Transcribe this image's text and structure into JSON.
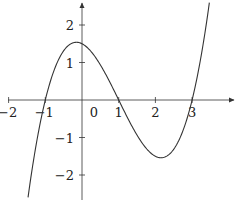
{
  "chart_data": {
    "type": "line",
    "title": "",
    "xlabel": "",
    "ylabel": "",
    "function": "f(x) = 0.5(x+1)(x-1)(x-3)",
    "x_ticks": [
      -2,
      -1,
      0,
      1,
      2,
      3
    ],
    "x_tick_labels": [
      "−2",
      "−1",
      "0",
      "1",
      "2",
      "3"
    ],
    "y_ticks": [
      2,
      1,
      -1,
      -2
    ],
    "y_tick_labels": [
      "2",
      "1",
      "−1",
      "−2"
    ],
    "xlim": [
      -2.0,
      4.2
    ],
    "ylim": [
      -2.7,
      2.6
    ],
    "grid": false,
    "legend": null,
    "roots": [
      -1,
      1,
      3
    ],
    "local_max": {
      "x": -0.15,
      "y": 1.54
    },
    "local_min": {
      "x": 2.15,
      "y": -1.54
    },
    "y_intercept": 1.5,
    "series": [
      {
        "name": "cubic",
        "x": [
          -1.47,
          -1.25,
          -1.0,
          -0.75,
          -0.5,
          -0.25,
          0.0,
          0.25,
          0.5,
          0.75,
          1.0,
          1.25,
          1.5,
          1.75,
          2.0,
          2.25,
          2.5,
          2.75,
          3.0,
          3.25,
          3.47
        ],
        "y": [
          -2.7,
          -1.5,
          0.0,
          0.86,
          1.31,
          1.53,
          1.5,
          1.31,
          0.94,
          0.47,
          0.0,
          -0.49,
          -0.94,
          -1.28,
          -1.5,
          -1.53,
          -1.31,
          -0.86,
          0.0,
          1.17,
          2.6
        ]
      }
    ],
    "color": "#333333"
  }
}
